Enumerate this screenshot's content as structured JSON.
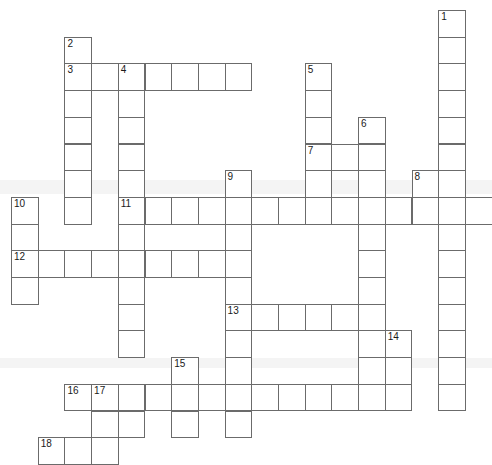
{
  "puzzle": {
    "title": "Crossword Puzzle Grid",
    "cell_size": 26.7,
    "origin_x": 11,
    "origin_y": 10,
    "cols": 18,
    "rows": 17,
    "grid_line_color": "#6b6b6b",
    "cell_fill_color": "#ffffff",
    "background_color": "#ffffff",
    "number_color": "#1a1a1a",
    "clue_numbers": [
      1,
      2,
      3,
      4,
      5,
      6,
      7,
      8,
      9,
      10,
      11,
      12,
      13,
      14,
      15,
      16,
      17,
      18
    ],
    "entries": [
      {
        "number": 1,
        "direction": "down",
        "row": 0,
        "col": 16,
        "length": 14
      },
      {
        "number": 2,
        "direction": "down",
        "row": 1,
        "col": 2,
        "length": 8
      },
      {
        "number": 3,
        "direction": "across",
        "row": 2,
        "col": 2,
        "length": 7
      },
      {
        "number": 4,
        "direction": "down",
        "row": 2,
        "col": 4,
        "length": 13
      },
      {
        "number": 5,
        "direction": "down",
        "row": 2,
        "col": 11,
        "length": 6
      },
      {
        "number": 6,
        "direction": "down",
        "row": 4,
        "col": 13,
        "length": 3
      },
      {
        "number": 7,
        "direction": "across",
        "row": 5,
        "col": 11,
        "length": 3
      },
      {
        "number": 8,
        "direction": "down",
        "row": 5,
        "col": 15,
        "length": 3
      },
      {
        "number": 9,
        "direction": "down",
        "row": 6,
        "col": 8,
        "length": 10
      },
      {
        "number": 10,
        "direction": "down",
        "row": 7,
        "col": 0,
        "length": 4
      },
      {
        "number": 11,
        "direction": "across",
        "row": 7,
        "col": 4,
        "length": 14
      },
      {
        "number": 12,
        "direction": "across",
        "row": 9,
        "col": 0,
        "length": 8
      },
      {
        "number": 13,
        "direction": "across",
        "row": 11,
        "col": 8,
        "length": 6
      },
      {
        "number": 14,
        "direction": "down",
        "row": 12,
        "col": 14,
        "length": 3
      },
      {
        "number": 15,
        "direction": "down",
        "row": 13,
        "col": 6,
        "length": 4
      },
      {
        "number": 16,
        "direction": "across",
        "row": 14,
        "col": 2,
        "length": 11
      },
      {
        "number": 17,
        "direction": "down",
        "row": 14,
        "col": 3,
        "length": 3
      },
      {
        "number": 18,
        "direction": "across",
        "row": 16,
        "col": 1,
        "length": 3
      }
    ],
    "cells": [
      {
        "row": 0,
        "col": 16,
        "num": "1"
      },
      {
        "row": 1,
        "col": 2,
        "num": "2"
      },
      {
        "row": 1,
        "col": 16,
        "num": ""
      },
      {
        "row": 2,
        "col": 2,
        "num": "3"
      },
      {
        "row": 2,
        "col": 3,
        "num": ""
      },
      {
        "row": 2,
        "col": 4,
        "num": "4"
      },
      {
        "row": 2,
        "col": 5,
        "num": ""
      },
      {
        "row": 2,
        "col": 6,
        "num": ""
      },
      {
        "row": 2,
        "col": 7,
        "num": ""
      },
      {
        "row": 2,
        "col": 8,
        "num": ""
      },
      {
        "row": 2,
        "col": 11,
        "num": "5"
      },
      {
        "row": 2,
        "col": 16,
        "num": ""
      },
      {
        "row": 3,
        "col": 2,
        "num": ""
      },
      {
        "row": 3,
        "col": 4,
        "num": ""
      },
      {
        "row": 3,
        "col": 11,
        "num": ""
      },
      {
        "row": 3,
        "col": 16,
        "num": ""
      },
      {
        "row": 4,
        "col": 2,
        "num": ""
      },
      {
        "row": 4,
        "col": 4,
        "num": ""
      },
      {
        "row": 4,
        "col": 11,
        "num": ""
      },
      {
        "row": 4,
        "col": 13,
        "num": "6"
      },
      {
        "row": 4,
        "col": 16,
        "num": ""
      },
      {
        "row": 5,
        "col": 2,
        "num": ""
      },
      {
        "row": 5,
        "col": 4,
        "num": ""
      },
      {
        "row": 5,
        "col": 11,
        "num": "7"
      },
      {
        "row": 5,
        "col": 12,
        "num": ""
      },
      {
        "row": 5,
        "col": 13,
        "num": ""
      },
      {
        "row": 5,
        "col": 16,
        "num": ""
      },
      {
        "row": 6,
        "col": 2,
        "num": ""
      },
      {
        "row": 6,
        "col": 4,
        "num": ""
      },
      {
        "row": 6,
        "col": 8,
        "num": "9"
      },
      {
        "row": 6,
        "col": 11,
        "num": ""
      },
      {
        "row": 6,
        "col": 13,
        "num": ""
      },
      {
        "row": 6,
        "col": 15,
        "num": "8"
      },
      {
        "row": 6,
        "col": 16,
        "num": ""
      },
      {
        "row": 7,
        "col": 0,
        "num": "10"
      },
      {
        "row": 7,
        "col": 2,
        "num": ""
      },
      {
        "row": 7,
        "col": 4,
        "num": "11"
      },
      {
        "row": 7,
        "col": 5,
        "num": ""
      },
      {
        "row": 7,
        "col": 6,
        "num": ""
      },
      {
        "row": 7,
        "col": 7,
        "num": ""
      },
      {
        "row": 7,
        "col": 8,
        "num": ""
      },
      {
        "row": 7,
        "col": 9,
        "num": ""
      },
      {
        "row": 7,
        "col": 10,
        "num": ""
      },
      {
        "row": 7,
        "col": 11,
        "num": ""
      },
      {
        "row": 7,
        "col": 12,
        "num": ""
      },
      {
        "row": 7,
        "col": 13,
        "num": ""
      },
      {
        "row": 7,
        "col": 14,
        "num": ""
      },
      {
        "row": 7,
        "col": 15,
        "num": ""
      },
      {
        "row": 7,
        "col": 16,
        "num": ""
      },
      {
        "row": 7,
        "col": 17,
        "num": ""
      },
      {
        "row": 8,
        "col": 0,
        "num": ""
      },
      {
        "row": 8,
        "col": 4,
        "num": ""
      },
      {
        "row": 8,
        "col": 8,
        "num": ""
      },
      {
        "row": 8,
        "col": 13,
        "num": ""
      },
      {
        "row": 8,
        "col": 16,
        "num": ""
      },
      {
        "row": 9,
        "col": 0,
        "num": "12"
      },
      {
        "row": 9,
        "col": 1,
        "num": ""
      },
      {
        "row": 9,
        "col": 2,
        "num": ""
      },
      {
        "row": 9,
        "col": 3,
        "num": ""
      },
      {
        "row": 9,
        "col": 4,
        "num": ""
      },
      {
        "row": 9,
        "col": 5,
        "num": ""
      },
      {
        "row": 9,
        "col": 6,
        "num": ""
      },
      {
        "row": 9,
        "col": 7,
        "num": ""
      },
      {
        "row": 9,
        "col": 8,
        "num": ""
      },
      {
        "row": 9,
        "col": 13,
        "num": ""
      },
      {
        "row": 9,
        "col": 16,
        "num": ""
      },
      {
        "row": 10,
        "col": 0,
        "num": ""
      },
      {
        "row": 10,
        "col": 4,
        "num": ""
      },
      {
        "row": 10,
        "col": 8,
        "num": ""
      },
      {
        "row": 10,
        "col": 13,
        "num": ""
      },
      {
        "row": 10,
        "col": 16,
        "num": ""
      },
      {
        "row": 11,
        "col": 4,
        "num": ""
      },
      {
        "row": 11,
        "col": 8,
        "num": "13"
      },
      {
        "row": 11,
        "col": 9,
        "num": ""
      },
      {
        "row": 11,
        "col": 10,
        "num": ""
      },
      {
        "row": 11,
        "col": 11,
        "num": ""
      },
      {
        "row": 11,
        "col": 12,
        "num": ""
      },
      {
        "row": 11,
        "col": 13,
        "num": ""
      },
      {
        "row": 11,
        "col": 16,
        "num": ""
      },
      {
        "row": 12,
        "col": 4,
        "num": ""
      },
      {
        "row": 12,
        "col": 8,
        "num": ""
      },
      {
        "row": 12,
        "col": 13,
        "num": ""
      },
      {
        "row": 12,
        "col": 14,
        "num": "14"
      },
      {
        "row": 12,
        "col": 16,
        "num": ""
      },
      {
        "row": 13,
        "col": 6,
        "num": "15"
      },
      {
        "row": 13,
        "col": 8,
        "num": ""
      },
      {
        "row": 13,
        "col": 13,
        "num": ""
      },
      {
        "row": 13,
        "col": 14,
        "num": ""
      },
      {
        "row": 13,
        "col": 16,
        "num": ""
      },
      {
        "row": 14,
        "col": 2,
        "num": "16"
      },
      {
        "row": 14,
        "col": 3,
        "num": "17"
      },
      {
        "row": 14,
        "col": 4,
        "num": ""
      },
      {
        "row": 14,
        "col": 5,
        "num": ""
      },
      {
        "row": 14,
        "col": 6,
        "num": ""
      },
      {
        "row": 14,
        "col": 7,
        "num": ""
      },
      {
        "row": 14,
        "col": 8,
        "num": ""
      },
      {
        "row": 14,
        "col": 9,
        "num": ""
      },
      {
        "row": 14,
        "col": 10,
        "num": ""
      },
      {
        "row": 14,
        "col": 11,
        "num": ""
      },
      {
        "row": 14,
        "col": 12,
        "num": ""
      },
      {
        "row": 14,
        "col": 13,
        "num": ""
      },
      {
        "row": 14,
        "col": 14,
        "num": ""
      },
      {
        "row": 14,
        "col": 16,
        "num": ""
      },
      {
        "row": 15,
        "col": 3,
        "num": ""
      },
      {
        "row": 15,
        "col": 4,
        "num": ""
      },
      {
        "row": 15,
        "col": 6,
        "num": ""
      },
      {
        "row": 15,
        "col": 8,
        "num": ""
      },
      {
        "row": 16,
        "col": 1,
        "num": "18"
      },
      {
        "row": 16,
        "col": 2,
        "num": ""
      },
      {
        "row": 16,
        "col": 3,
        "num": ""
      }
    ]
  }
}
